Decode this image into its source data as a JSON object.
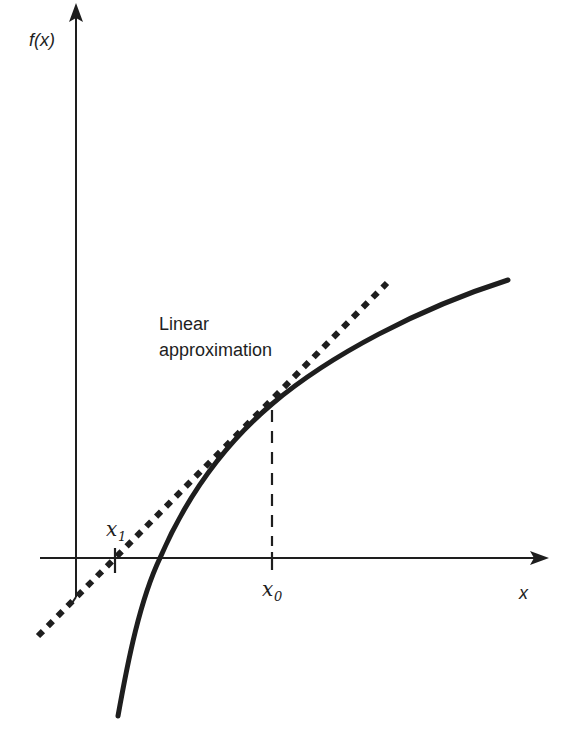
{
  "diagram": {
    "colors": {
      "ink": "#1e1e1e",
      "background": "#ffffff"
    },
    "axes": {
      "y_label": "f(x)",
      "x_label": "x"
    },
    "annotations": {
      "linear_approx_line1": "Linear",
      "linear_approx_line2": "approximation",
      "x0_label": "x",
      "x0_subscript": "0",
      "x1_label": "x",
      "x1_subscript": "1"
    },
    "elements": {
      "curve": "f(x) concave increasing curve",
      "tangent": "dotted tangent line at x0",
      "x0_marker": "dashed vertical from curve point to x-axis",
      "x1_marker": "tick where tangent crosses x-axis"
    }
  }
}
